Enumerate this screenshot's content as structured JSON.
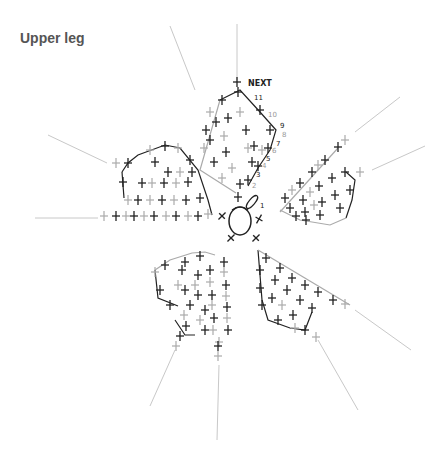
{
  "title": "Upper leg",
  "colors": {
    "dark_stitch": "#222222",
    "light_stitch": "#aaaaaa",
    "guide_line": "#c8c8c8",
    "title": "#555555"
  },
  "diagram": {
    "type": "crochet stitch chart",
    "center": "magic ring",
    "petals": 5,
    "labels": {
      "next": "NEXT",
      "rows": [
        "1",
        "2",
        "3",
        "4",
        "5",
        "6",
        "7",
        "8",
        "9",
        "10",
        "11"
      ]
    }
  }
}
